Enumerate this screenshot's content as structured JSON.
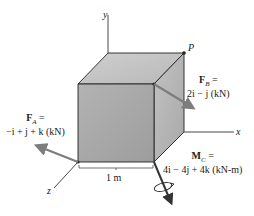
{
  "figure": {
    "axes": {
      "x_label": "x",
      "y_label": "y",
      "z_label": "z"
    },
    "point_label": "P",
    "dimension_label": "1 m",
    "forces": {
      "FA": {
        "symbol": "F",
        "subscript": "A",
        "equals": "=",
        "expression": "−i + j + k (kN)"
      },
      "FB": {
        "symbol": "F",
        "subscript": "B",
        "equals": "=",
        "expression": "2i − j (kN)"
      }
    },
    "moment": {
      "MC": {
        "symbol": "M",
        "subscript": "C",
        "equals": "=",
        "expression": "4i − 4j + 4k (kN-m)"
      }
    },
    "colors": {
      "front_face": "#a9a9a9",
      "top_face": "#c4c4c4",
      "side_face": "#b6b6b6",
      "edge": "#222222",
      "arrow": "#7d7d7d",
      "background": "#ffffff"
    }
  }
}
